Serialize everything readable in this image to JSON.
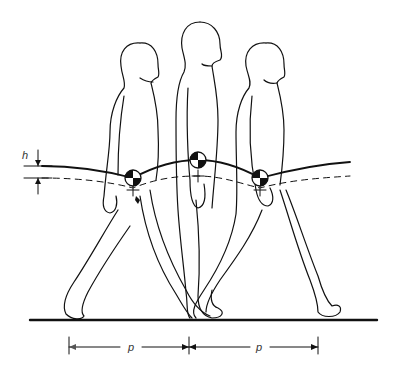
{
  "diagram": {
    "type": "gait-center-of-mass",
    "figures": [
      {
        "id": "left",
        "phase": "double-support-rear",
        "com": {
          "x": 133,
          "y": 178
        }
      },
      {
        "id": "middle",
        "phase": "mid-stance",
        "com": {
          "x": 198,
          "y": 160
        }
      },
      {
        "id": "right",
        "phase": "double-support-front",
        "com": {
          "x": 260,
          "y": 178
        }
      }
    ],
    "labels": {
      "height": "h",
      "pace_left": "p",
      "pace_right": "p"
    },
    "colors": {
      "ink": "#111111",
      "background": "#ffffff"
    }
  }
}
